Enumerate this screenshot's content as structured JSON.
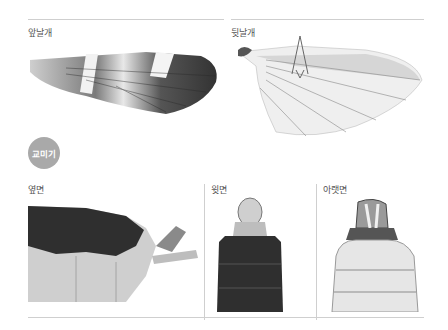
{
  "wings": {
    "fore_label": "앞날개",
    "hind_label": "뒷날개"
  },
  "section_badge": "교미기",
  "genitalia": {
    "lateral_label": "옆면",
    "dorsal_label": "윗면",
    "ventral_label": "아랫면"
  }
}
